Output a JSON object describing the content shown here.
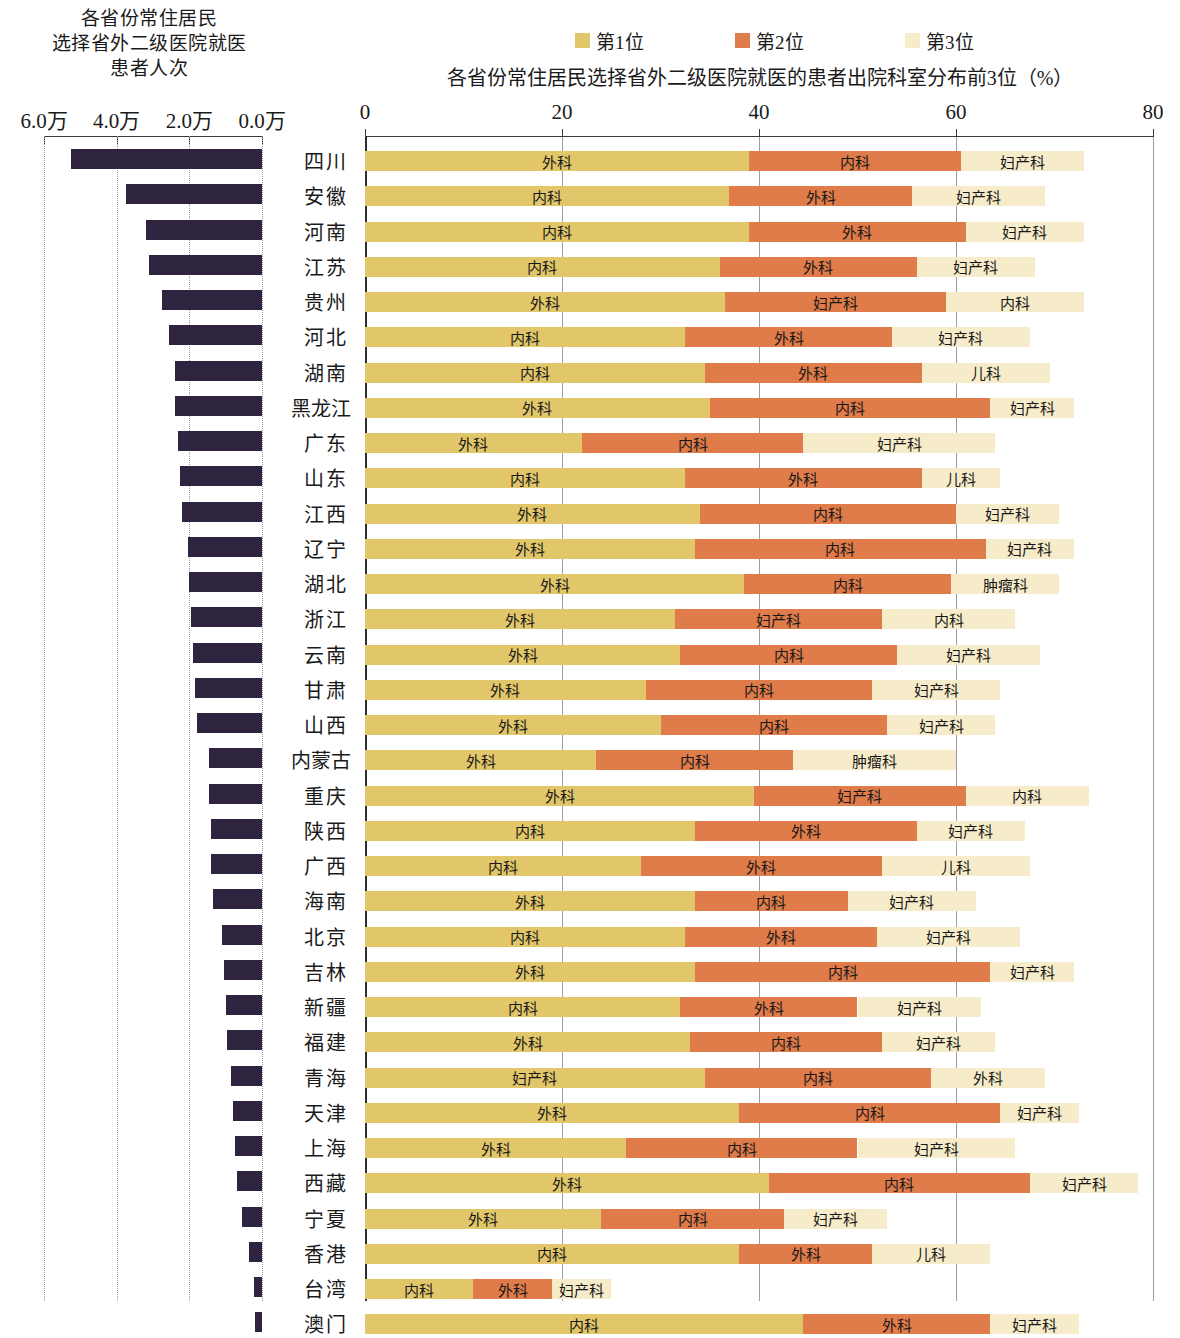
{
  "left_panel": {
    "title_lines": [
      "各省份常住居民",
      "选择省外二级医院就医",
      "患者人次"
    ],
    "axis_ticks": [
      "6.0万",
      "4.0万",
      "2.0万",
      "0.0万"
    ],
    "axis_tick_values": [
      6.0,
      4.0,
      2.0,
      0.0
    ],
    "bar_color": "#2e2440",
    "unit": "万"
  },
  "right_panel": {
    "title": "各省份常住居民选择省外二级医院就医的患者出院科室分布前3位（%）",
    "axis_ticks": [
      "0",
      "20",
      "40",
      "60",
      "80"
    ],
    "axis_tick_values": [
      0,
      20,
      40,
      60,
      80
    ],
    "legend": [
      {
        "label": "第1位",
        "color": "#e2c76a",
        "icon": "legend-swatch-rank1"
      },
      {
        "label": "第2位",
        "color": "#e07b4a",
        "icon": "legend-swatch-rank2"
      },
      {
        "label": "第3位",
        "color": "#f6ecc9",
        "icon": "legend-swatch-rank3"
      }
    ]
  },
  "chart_data": {
    "type": "bar",
    "title": "各省份常住居民选择省外二级医院就医的患者出院科室分布前3位（%）",
    "left_title": "各省份常住居民选择省外二级医院就医患者人次",
    "xlabel": "",
    "ylabel": "",
    "grid": true,
    "legend_position": "top",
    "left_axis": {
      "ticks": [
        6.0,
        4.0,
        2.0,
        0.0
      ],
      "unit": "万",
      "direction": "right-to-left",
      "range": [
        0,
        6.0
      ]
    },
    "right_axis": {
      "ticks": [
        0,
        20,
        40,
        60,
        80
      ],
      "unit": "%",
      "range": [
        0,
        80
      ]
    },
    "categories": [
      "四川",
      "安徽",
      "河南",
      "江苏",
      "贵州",
      "河北",
      "湖南",
      "黑龙江",
      "广东",
      "山东",
      "江西",
      "辽宁",
      "湖北",
      "浙江",
      "云南",
      "甘肃",
      "山西",
      "内蒙古",
      "重庆",
      "陕西",
      "广西",
      "海南",
      "北京",
      "吉林",
      "新疆",
      "福建",
      "青海",
      "天津",
      "上海",
      "西藏",
      "宁夏",
      "香港",
      "台湾",
      "澳门"
    ],
    "rows": [
      {
        "province": "四川",
        "visits_wan": 5.25,
        "ranks": [
          {
            "dept": "外科",
            "pct": 39.0
          },
          {
            "dept": "内科",
            "pct": 21.5
          },
          {
            "dept": "妇产科",
            "pct": 12.5
          }
        ]
      },
      {
        "province": "安徽",
        "visits_wan": 3.75,
        "ranks": [
          {
            "dept": "内科",
            "pct": 37.0
          },
          {
            "dept": "外科",
            "pct": 18.5
          },
          {
            "dept": "妇产科",
            "pct": 13.5
          }
        ]
      },
      {
        "province": "河南",
        "visits_wan": 3.2,
        "ranks": [
          {
            "dept": "内科",
            "pct": 39.0
          },
          {
            "dept": "外科",
            "pct": 22.0
          },
          {
            "dept": "妇产科",
            "pct": 12.0
          }
        ]
      },
      {
        "province": "江苏",
        "visits_wan": 3.1,
        "ranks": [
          {
            "dept": "内科",
            "pct": 36.0
          },
          {
            "dept": "外科",
            "pct": 20.0
          },
          {
            "dept": "妇产科",
            "pct": 12.0
          }
        ]
      },
      {
        "province": "贵州",
        "visits_wan": 2.75,
        "ranks": [
          {
            "dept": "外科",
            "pct": 36.5
          },
          {
            "dept": "妇产科",
            "pct": 22.5
          },
          {
            "dept": "内科",
            "pct": 14.0
          }
        ]
      },
      {
        "province": "河北",
        "visits_wan": 2.55,
        "ranks": [
          {
            "dept": "内科",
            "pct": 32.5
          },
          {
            "dept": "外科",
            "pct": 21.0
          },
          {
            "dept": "妇产科",
            "pct": 14.0
          }
        ]
      },
      {
        "province": "湖南",
        "visits_wan": 2.4,
        "ranks": [
          {
            "dept": "内科",
            "pct": 34.5
          },
          {
            "dept": "外科",
            "pct": 22.0
          },
          {
            "dept": "儿科",
            "pct": 13.0
          }
        ]
      },
      {
        "province": "黑龙江",
        "visits_wan": 2.4,
        "ranks": [
          {
            "dept": "外科",
            "pct": 35.0
          },
          {
            "dept": "内科",
            "pct": 28.5
          },
          {
            "dept": "妇产科",
            "pct": 8.5
          }
        ]
      },
      {
        "province": "广东",
        "visits_wan": 2.3,
        "ranks": [
          {
            "dept": "外科",
            "pct": 22.0
          },
          {
            "dept": "内科",
            "pct": 22.5
          },
          {
            "dept": "妇产科",
            "pct": 19.5
          }
        ]
      },
      {
        "province": "山东",
        "visits_wan": 2.25,
        "ranks": [
          {
            "dept": "内科",
            "pct": 32.5
          },
          {
            "dept": "外科",
            "pct": 24.0
          },
          {
            "dept": "儿科",
            "pct": 8.0
          }
        ]
      },
      {
        "province": "江西",
        "visits_wan": 2.2,
        "ranks": [
          {
            "dept": "外科",
            "pct": 34.0
          },
          {
            "dept": "内科",
            "pct": 26.0
          },
          {
            "dept": "妇产科",
            "pct": 10.5
          }
        ]
      },
      {
        "province": "辽宁",
        "visits_wan": 2.05,
        "ranks": [
          {
            "dept": "外科",
            "pct": 33.5
          },
          {
            "dept": "内科",
            "pct": 29.5
          },
          {
            "dept": "妇产科",
            "pct": 9.0
          }
        ]
      },
      {
        "province": "湖北",
        "visits_wan": 2.0,
        "ranks": [
          {
            "dept": "外科",
            "pct": 38.5
          },
          {
            "dept": "内科",
            "pct": 21.0
          },
          {
            "dept": "肿瘤科",
            "pct": 11.0
          }
        ]
      },
      {
        "province": "浙江",
        "visits_wan": 1.95,
        "ranks": [
          {
            "dept": "外科",
            "pct": 31.5
          },
          {
            "dept": "妇产科",
            "pct": 21.0
          },
          {
            "dept": "内科",
            "pct": 13.5
          }
        ]
      },
      {
        "province": "云南",
        "visits_wan": 1.9,
        "ranks": [
          {
            "dept": "外科",
            "pct": 32.0
          },
          {
            "dept": "内科",
            "pct": 22.0
          },
          {
            "dept": "妇产科",
            "pct": 14.5
          }
        ]
      },
      {
        "province": "甘肃",
        "visits_wan": 1.85,
        "ranks": [
          {
            "dept": "外科",
            "pct": 28.5
          },
          {
            "dept": "内科",
            "pct": 23.0
          },
          {
            "dept": "妇产科",
            "pct": 13.0
          }
        ]
      },
      {
        "province": "山西",
        "visits_wan": 1.8,
        "ranks": [
          {
            "dept": "外科",
            "pct": 30.0
          },
          {
            "dept": "内科",
            "pct": 23.0
          },
          {
            "dept": "妇产科",
            "pct": 11.0
          }
        ]
      },
      {
        "province": "内蒙古",
        "visits_wan": 1.45,
        "ranks": [
          {
            "dept": "外科",
            "pct": 23.5
          },
          {
            "dept": "内科",
            "pct": 20.0
          },
          {
            "dept": "肿瘤科",
            "pct": 16.5
          }
        ]
      },
      {
        "province": "重庆",
        "visits_wan": 1.45,
        "ranks": [
          {
            "dept": "外科",
            "pct": 39.5
          },
          {
            "dept": "妇产科",
            "pct": 21.5
          },
          {
            "dept": "内科",
            "pct": 12.5
          }
        ]
      },
      {
        "province": "陕西",
        "visits_wan": 1.4,
        "ranks": [
          {
            "dept": "内科",
            "pct": 33.5
          },
          {
            "dept": "外科",
            "pct": 22.5
          },
          {
            "dept": "妇产科",
            "pct": 11.0
          }
        ]
      },
      {
        "province": "广西",
        "visits_wan": 1.4,
        "ranks": [
          {
            "dept": "内科",
            "pct": 28.0
          },
          {
            "dept": "外科",
            "pct": 24.5
          },
          {
            "dept": "儿科",
            "pct": 15.0
          }
        ]
      },
      {
        "province": "海南",
        "visits_wan": 1.35,
        "ranks": [
          {
            "dept": "外科",
            "pct": 33.5
          },
          {
            "dept": "内科",
            "pct": 15.5
          },
          {
            "dept": "妇产科",
            "pct": 13.0
          }
        ]
      },
      {
        "province": "北京",
        "visits_wan": 1.1,
        "ranks": [
          {
            "dept": "内科",
            "pct": 32.5
          },
          {
            "dept": "外科",
            "pct": 19.5
          },
          {
            "dept": "妇产科",
            "pct": 14.5
          }
        ]
      },
      {
        "province": "吉林",
        "visits_wan": 1.05,
        "ranks": [
          {
            "dept": "外科",
            "pct": 33.5
          },
          {
            "dept": "内科",
            "pct": 30.0
          },
          {
            "dept": "妇产科",
            "pct": 8.5
          }
        ]
      },
      {
        "province": "新疆",
        "visits_wan": 1.0,
        "ranks": [
          {
            "dept": "内科",
            "pct": 32.0
          },
          {
            "dept": "外科",
            "pct": 18.0
          },
          {
            "dept": "妇产科",
            "pct": 12.5
          }
        ]
      },
      {
        "province": "福建",
        "visits_wan": 0.95,
        "ranks": [
          {
            "dept": "外科",
            "pct": 33.0
          },
          {
            "dept": "内科",
            "pct": 19.5
          },
          {
            "dept": "妇产科",
            "pct": 11.5
          }
        ]
      },
      {
        "province": "青海",
        "visits_wan": 0.85,
        "ranks": [
          {
            "dept": "妇产科",
            "pct": 34.5
          },
          {
            "dept": "内科",
            "pct": 23.0
          },
          {
            "dept": "外科",
            "pct": 11.5
          }
        ]
      },
      {
        "province": "天津",
        "visits_wan": 0.8,
        "ranks": [
          {
            "dept": "外科",
            "pct": 38.0
          },
          {
            "dept": "内科",
            "pct": 26.5
          },
          {
            "dept": "妇产科",
            "pct": 8.0
          }
        ]
      },
      {
        "province": "上海",
        "visits_wan": 0.75,
        "ranks": [
          {
            "dept": "外科",
            "pct": 26.5
          },
          {
            "dept": "内科",
            "pct": 23.5
          },
          {
            "dept": "妇产科",
            "pct": 16.0
          }
        ]
      },
      {
        "province": "西藏",
        "visits_wan": 0.7,
        "ranks": [
          {
            "dept": "外科",
            "pct": 41.0
          },
          {
            "dept": "内科",
            "pct": 26.5
          },
          {
            "dept": "妇产科",
            "pct": 11.0
          }
        ]
      },
      {
        "province": "宁夏",
        "visits_wan": 0.55,
        "ranks": [
          {
            "dept": "外科",
            "pct": 24.0
          },
          {
            "dept": "内科",
            "pct": 18.5
          },
          {
            "dept": "妇产科",
            "pct": 10.5
          }
        ]
      },
      {
        "province": "香港",
        "visits_wan": 0.35,
        "ranks": [
          {
            "dept": "内科",
            "pct": 38.0
          },
          {
            "dept": "外科",
            "pct": 13.5
          },
          {
            "dept": "儿科",
            "pct": 12.0
          }
        ]
      },
      {
        "province": "台湾",
        "visits_wan": 0.22,
        "ranks": [
          {
            "dept": "内科",
            "pct": 11.0
          },
          {
            "dept": "外科",
            "pct": 8.0
          },
          {
            "dept": "妇产科",
            "pct": 6.0
          }
        ]
      },
      {
        "province": "澳门",
        "visits_wan": 0.18,
        "ranks": [
          {
            "dept": "内科",
            "pct": 44.5
          },
          {
            "dept": "外科",
            "pct": 19.0
          },
          {
            "dept": "妇产科",
            "pct": 9.0
          }
        ]
      }
    ]
  }
}
